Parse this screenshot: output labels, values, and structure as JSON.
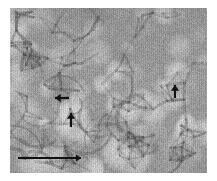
{
  "figure": {
    "type": "micrograph",
    "modality": "grayscale electron micrograph",
    "panel": {
      "left": 10,
      "top": 8,
      "width": 197,
      "height": 165,
      "background_color": "#9a9a9a",
      "border_color": "#ffffff"
    },
    "tone": {
      "darkest": "#5c5c5c",
      "mid": "#9a9a9a",
      "lightest": "#d4d4d4",
      "annotation_color": "#111111",
      "page_background": "#ffffff"
    },
    "texture": {
      "description": "granular light grains separated by darker grain boundaries; coarser grains toward lower-left",
      "grain_count": 150,
      "grain_radius_min": 6,
      "grain_radius_max": 18,
      "seed": 20240517
    },
    "annotations": [
      {
        "id": "arrow-left-pointing",
        "name": "annotation-arrow-left",
        "direction": "left",
        "tip_x": 55,
        "tip_y": 98,
        "tail_x": 69,
        "tail_y": 98,
        "length": 14,
        "thickness": 2.2,
        "color": "#111111"
      },
      {
        "id": "arrow-up-center",
        "name": "annotation-arrow-up-center",
        "direction": "up",
        "tip_x": 71,
        "tip_y": 113,
        "tail_x": 71,
        "tail_y": 127,
        "length": 14,
        "thickness": 2.2,
        "color": "#111111"
      },
      {
        "id": "arrow-up-right",
        "name": "annotation-arrow-up-right",
        "direction": "up",
        "tip_x": 175,
        "tip_y": 85,
        "tail_x": 175,
        "tail_y": 98,
        "length": 13,
        "thickness": 2.2,
        "color": "#111111"
      }
    ],
    "scale_bar": {
      "name": "scale-bar-arrow",
      "style": "arrow",
      "direction": "right",
      "start_x": 18,
      "end_x": 81,
      "y": 158,
      "length_px": 63,
      "thickness": 2.0,
      "color": "#111111",
      "label": ""
    }
  }
}
